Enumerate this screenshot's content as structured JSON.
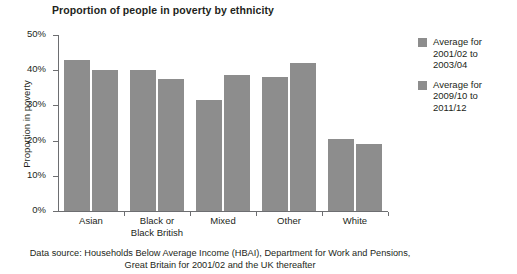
{
  "chart_data": {
    "type": "bar",
    "title": "Proportion of people in poverty by ethnicity",
    "xlabel": "",
    "ylabel": "Proportion in poverty",
    "ylim": [
      0,
      50
    ],
    "ytick_labels": [
      "0%",
      "10%",
      "20%",
      "30%",
      "40%",
      "50%"
    ],
    "ytick_values": [
      0,
      10,
      20,
      30,
      40,
      50
    ],
    "grid": false,
    "legend_position": "right",
    "categories": [
      "Asian",
      "Black or Black British",
      "Mixed",
      "Other",
      "White"
    ],
    "category_lines": [
      [
        "Asian"
      ],
      [
        "Black or",
        "Black British"
      ],
      [
        "Mixed"
      ],
      [
        "Other"
      ],
      [
        "White"
      ]
    ],
    "series": [
      {
        "name": "Average for 2001/02 to 2003/04",
        "name_lines": [
          "Average for",
          "2001/02 to",
          "2003/04"
        ],
        "color": "#8d8d8d",
        "values": [
          43,
          40,
          31.5,
          38,
          20.5
        ]
      },
      {
        "name": "Average for 2009/10 to 2011/12",
        "name_lines": [
          "Average for",
          "2009/10 to",
          "2011/12"
        ],
        "color": "#8d8d8d",
        "values": [
          40,
          37.5,
          38.5,
          42,
          19
        ]
      }
    ]
  },
  "footnote": {
    "line1": "Data source: Households Below Average Income (HBAI), Department for Work and Pensions,",
    "line2": "Great Britain for 2001/02 and the UK thereafter"
  }
}
